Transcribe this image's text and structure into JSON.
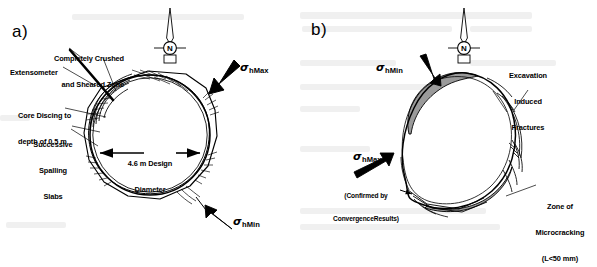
{
  "figure": {
    "type": "technical-diagram"
  },
  "panels": [
    {
      "id": "a",
      "label": "a)",
      "compass": {
        "letter": "N",
        "name": "north-arrow"
      },
      "stress_labels": [
        {
          "symbol": "σ",
          "subscript": "hMax",
          "position": "upper-right"
        },
        {
          "symbol": "σ",
          "subscript": "hMin",
          "position": "lower-right"
        }
      ],
      "annotations": [
        {
          "name": "crushed-zone",
          "lines": [
            "Completely Crushed",
            "and Sheared Zone"
          ]
        },
        {
          "name": "extensometer",
          "lines": [
            "Extensometer"
          ]
        },
        {
          "name": "core-discing",
          "lines": [
            "Core Discing to",
            "depth of 0.5 m"
          ]
        },
        {
          "name": "spalling-slabs",
          "lines": [
            "Successive",
            "Spalling",
            "Slabs"
          ]
        }
      ],
      "dimension": {
        "name": "design-diameter",
        "lines": [
          "4.6 m Design",
          "Diameter"
        ],
        "value": "4.6 m"
      }
    },
    {
      "id": "b",
      "label": "b)",
      "compass": {
        "letter": "N",
        "name": "north-arrow"
      },
      "stress_labels": [
        {
          "symbol": "σ",
          "subscript": "hMin",
          "position": "top"
        },
        {
          "symbol": "σ",
          "subscript": "hMax",
          "position": "left",
          "note": [
            "(Confirmed by",
            "ConvergenceResults)"
          ]
        }
      ],
      "annotations": [
        {
          "name": "excavation-induced-fractures",
          "lines": [
            "Excavation",
            "Induced",
            "Fractures"
          ]
        },
        {
          "name": "zone-of-microcracking",
          "lines": [
            "Zone of",
            "Microcracking",
            "(L<50 mm)"
          ]
        }
      ]
    }
  ],
  "colors": {
    "ink": "#000000",
    "background": "#ffffff",
    "shading": "#9a9a9a",
    "bleed": "#e8e8e8"
  },
  "text": {
    "a_label": "a)",
    "b_label": "b)",
    "compass_n": "N",
    "a_crushed_1": "Completely Crushed",
    "a_crushed_2": "and Sheared Zone",
    "a_extensometer": "Extensometer",
    "a_discing_1": "Core Discing to",
    "a_discing_2": "depth of 0.5 m",
    "a_spalling_1": "Successive",
    "a_spalling_2": "Spalling",
    "a_spalling_3": "Slabs",
    "a_diameter_1": "4.6 m Design",
    "a_diameter_2": "Diameter",
    "b_fractures_1": "Excavation",
    "b_fractures_2": "Induced",
    "b_fractures_3": "Fractures",
    "b_micro_1": "Zone of",
    "b_micro_2": "Microcracking",
    "b_micro_3": "(L<50 mm)",
    "b_confirm_1": "(Confirmed by",
    "b_confirm_2": "ConvergenceResults)",
    "sigma": "σ",
    "sub_hmax": "hMax",
    "sub_hmin": "hMin"
  }
}
